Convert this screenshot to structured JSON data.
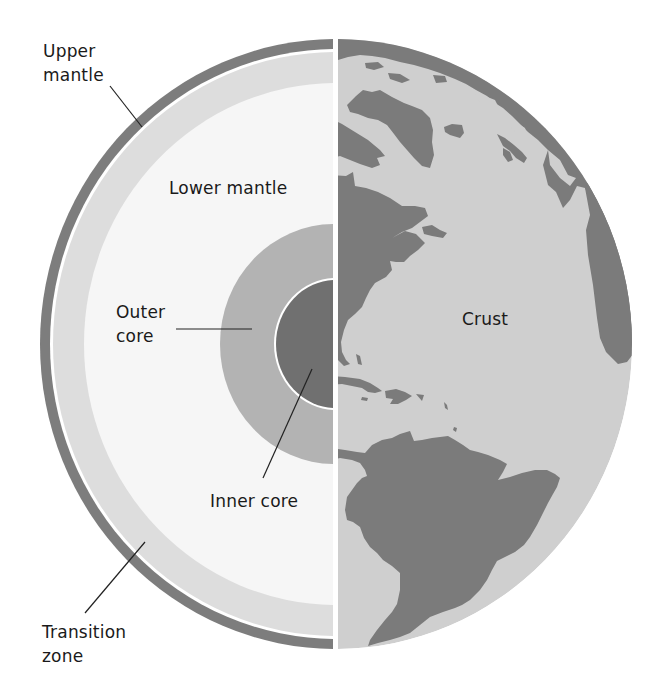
{
  "diagram": {
    "colors": {
      "background": "#ffffff",
      "upper_mantle": "#7d7d7d",
      "transition_zone": "#dddddd",
      "lower_mantle": "#f6f6f6",
      "outer_core": "#b3b3b3",
      "inner_core": "#707070",
      "ocean": "#cfcfcf",
      "land": "#7b7b7b",
      "leader_line": "#222222",
      "text": "#1a1a1a"
    },
    "labels": {
      "upper_mantle": {
        "line1": "Upper",
        "line2": "mantle"
      },
      "lower_mantle": "Lower mantle",
      "outer_core": {
        "line1": "Outer",
        "line2": "core"
      },
      "inner_core": "Inner core",
      "crust": "Crust",
      "transition_zone": {
        "line1": "Transition",
        "line2": "zone"
      }
    },
    "geometry": {
      "globe": {
        "cx": 336,
        "cy": 344,
        "rx": 296,
        "ry": 305
      },
      "split_gap_x": [
        333,
        338
      ],
      "layers_left_half": [
        {
          "name": "upper-mantle",
          "rx": 296,
          "ry": 305
        },
        {
          "name": "white-gap",
          "rx": 286,
          "ry": 295
        },
        {
          "name": "transition-zone",
          "rx": 283,
          "ry": 292
        },
        {
          "name": "lower-mantle",
          "rx": 252,
          "ry": 261
        },
        {
          "name": "outer-core",
          "rx": 114,
          "ry": 120
        },
        {
          "name": "inner-core",
          "rx": 60,
          "ry": 64
        }
      ]
    }
  }
}
